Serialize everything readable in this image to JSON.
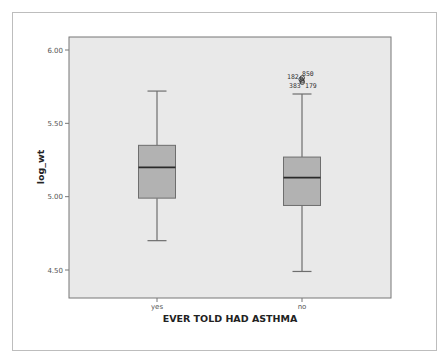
{
  "chart_data": {
    "type": "boxplot",
    "title": "",
    "xlabel": "EVER TOLD HAD ASTHMA",
    "ylabel": "log_wt",
    "ylim": [
      4.32,
      6.09
    ],
    "yticks": [
      4.5,
      5.0,
      5.5,
      6.0
    ],
    "ytick_labels": [
      "4.50",
      "5.00",
      "5.50",
      "6.00"
    ],
    "grid": false,
    "legend": null,
    "categories": [
      "yes",
      "no"
    ],
    "series": [
      {
        "name": "yes",
        "whisker_low": 4.7,
        "q1": 4.99,
        "median": 5.2,
        "q3": 5.35,
        "whisker_high": 5.72,
        "outliers": []
      },
      {
        "name": "no",
        "whisker_low": 4.49,
        "q1": 4.94,
        "median": 5.13,
        "q3": 5.27,
        "whisker_high": 5.7,
        "outliers": [
          {
            "label": "182",
            "value": 5.8
          },
          {
            "label": "850",
            "value": 5.81
          },
          {
            "label": "383",
            "value": 5.79
          },
          {
            "label": "179",
            "value": 5.78
          }
        ]
      }
    ]
  },
  "colors": {
    "plot_background": "#e9e9e9",
    "box_fill": "#b2b2b2",
    "box_stroke": "#6e6e6e",
    "median_line": "#2a2a2a",
    "whisker": "#6e6e6e",
    "frame_border": "#bdbdbd",
    "axis_line": "#777777"
  }
}
